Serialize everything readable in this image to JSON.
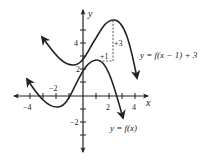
{
  "figure": {
    "type": "function graph transformation",
    "axes": {
      "x_label": "x",
      "y_label": "y",
      "x_ticks": [
        -4,
        -3,
        -2,
        -1,
        1,
        2,
        3,
        4
      ],
      "x_tick_labels": {
        "neg4": "−4",
        "neg2": "−2",
        "pos2": "2",
        "pos4": "4"
      },
      "y_ticks": [
        -3,
        -2,
        -1,
        1,
        2,
        3,
        4,
        5
      ],
      "y_tick_labels": {
        "neg2": "−2",
        "pos2": "2",
        "pos4": "4"
      }
    },
    "curves": [
      {
        "name": "original",
        "label": "y = f(x)",
        "key_points": {
          "local_min": [
            -2,
            -0.8
          ],
          "local_max": [
            1,
            2.8
          ]
        }
      },
      {
        "name": "transformed",
        "label": "y = f(x − 1) + 3",
        "key_points": {
          "local_min": [
            -1,
            2.2
          ],
          "local_max": [
            2.4,
            5.8
          ]
        }
      }
    ],
    "annotations": {
      "horizontal_shift": "+1",
      "vertical_shift": "+3"
    },
    "labels": {
      "f_label": "y = f(x)",
      "g_label": "y = f(x − 1) + 3",
      "x_axis": "x",
      "y_axis": "y",
      "shift_h": "+1",
      "shift_v": "+3",
      "xneg4": "−4",
      "xneg2": "−2",
      "x2": "2",
      "x4": "4",
      "yneg2": "−2",
      "y2": "2",
      "y4": "4"
    }
  }
}
